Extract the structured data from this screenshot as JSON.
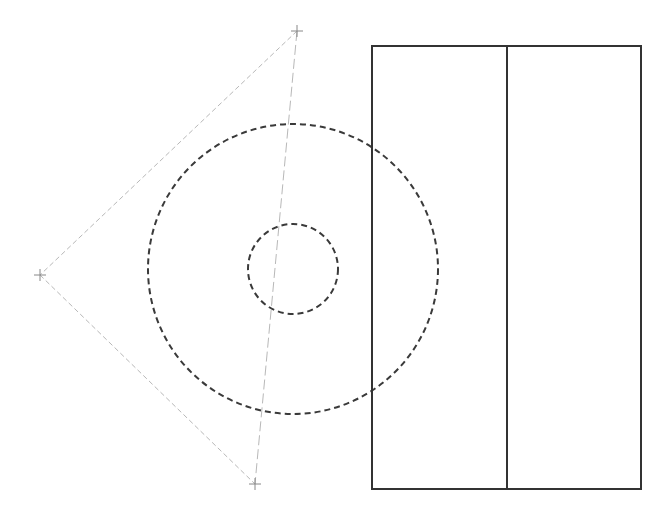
{
  "canvas": {
    "width": 669,
    "height": 512,
    "background": "#ffffff"
  },
  "colors": {
    "solid": "#333333",
    "dashed_circle": "#3a3a3a",
    "construction": "#b8b8b8",
    "marker": "#888888"
  },
  "markers": [
    {
      "id": "top",
      "x": 297,
      "y": 31
    },
    {
      "id": "left",
      "x": 40,
      "y": 275
    },
    {
      "id": "bottom",
      "x": 255,
      "y": 484
    }
  ],
  "construction_lines": [
    {
      "id": "top-left",
      "x1": 297,
      "y1": 31,
      "x2": 40,
      "y2": 275,
      "dash": "5 3"
    },
    {
      "id": "left-bottom",
      "x1": 40,
      "y1": 275,
      "x2": 255,
      "y2": 484,
      "dash": "5 3"
    },
    {
      "id": "top-bottom",
      "x1": 297,
      "y1": 31,
      "x2": 255,
      "y2": 484,
      "dash": "10 4"
    }
  ],
  "circles": [
    {
      "id": "outer",
      "cx": 293,
      "cy": 269,
      "r": 145,
      "dash": "6 4"
    },
    {
      "id": "inner",
      "cx": 293,
      "cy": 269,
      "r": 45,
      "dash": "6 4"
    }
  ],
  "rectangle": {
    "x": 372,
    "y": 46,
    "width": 269,
    "height": 443
  },
  "divider": {
    "x": 507,
    "y1": 46,
    "y2": 489
  }
}
